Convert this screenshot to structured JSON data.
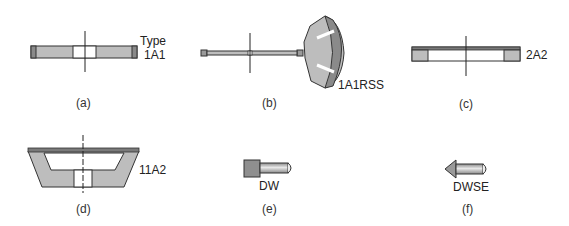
{
  "figures": [
    {
      "id": "a",
      "caption": "(a)",
      "type_label_line1": "Type",
      "type_label_line2": "1A1"
    },
    {
      "id": "b",
      "caption": "(b)",
      "type_label": "1A1RSS"
    },
    {
      "id": "c",
      "caption": "(c)",
      "type_label": "2A2"
    },
    {
      "id": "d",
      "caption": "(d)",
      "type_label": "11A2"
    },
    {
      "id": "e",
      "caption": "(e)",
      "type_label": "DW"
    },
    {
      "id": "f",
      "caption": "(f)",
      "type_label": "DWSE"
    }
  ],
  "colors": {
    "fill_gray": "#b9b9b9",
    "dark_gray": "#7a7a7a",
    "outline": "#333333",
    "background": "#ffffff"
  }
}
